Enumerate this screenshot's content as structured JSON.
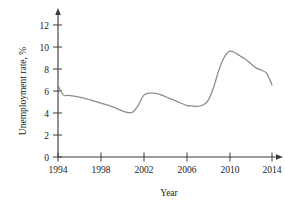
{
  "chart_data": {
    "type": "line",
    "title": "",
    "subtitle": "",
    "xlabel": "Year",
    "ylabel": "Unemployment rate, %",
    "xlim": [
      1994,
      2015
    ],
    "ylim": [
      0,
      13
    ],
    "grid": false,
    "legend": null,
    "legend_position": "none",
    "xticks": [
      1994,
      1998,
      2002,
      2006,
      2010,
      2014
    ],
    "xtick_labels": [
      "1994",
      "1998",
      "2002",
      "2006",
      "2010",
      "2014"
    ],
    "yticks": [
      0,
      2,
      4,
      6,
      8,
      10,
      12
    ],
    "ytick_labels": [
      "0",
      "2",
      "4",
      "6",
      "8",
      "10",
      "12"
    ],
    "line_color": "#8c8c8c",
    "axis_color": "#3a3a3a",
    "series": [
      {
        "name": "Unemployment rate",
        "x": [
          1994,
          1994.5,
          1995,
          1996,
          1997,
          1998,
          1999,
          2000,
          2000.5,
          2001,
          2001.5,
          2002,
          2002.5,
          2003,
          2003.5,
          2004,
          2005,
          2006,
          2006.5,
          2007,
          2007.5,
          2008,
          2008.5,
          2009,
          2009.5,
          2010,
          2010.5,
          2011,
          2011.5,
          2012,
          2012.5,
          2013,
          2013.5,
          2014
        ],
        "values": [
          6.5,
          5.65,
          5.6,
          5.45,
          5.2,
          4.9,
          4.6,
          4.2,
          4.05,
          4.1,
          4.7,
          5.6,
          5.8,
          5.8,
          5.7,
          5.5,
          5.1,
          4.7,
          4.65,
          4.6,
          4.7,
          5.1,
          6.2,
          7.8,
          9.0,
          9.6,
          9.5,
          9.2,
          8.9,
          8.5,
          8.1,
          7.9,
          7.6,
          6.55
        ]
      }
    ],
    "annotations": []
  },
  "axis": {
    "y_arrow": "up-arrow",
    "x_arrow": "right-arrow"
  }
}
